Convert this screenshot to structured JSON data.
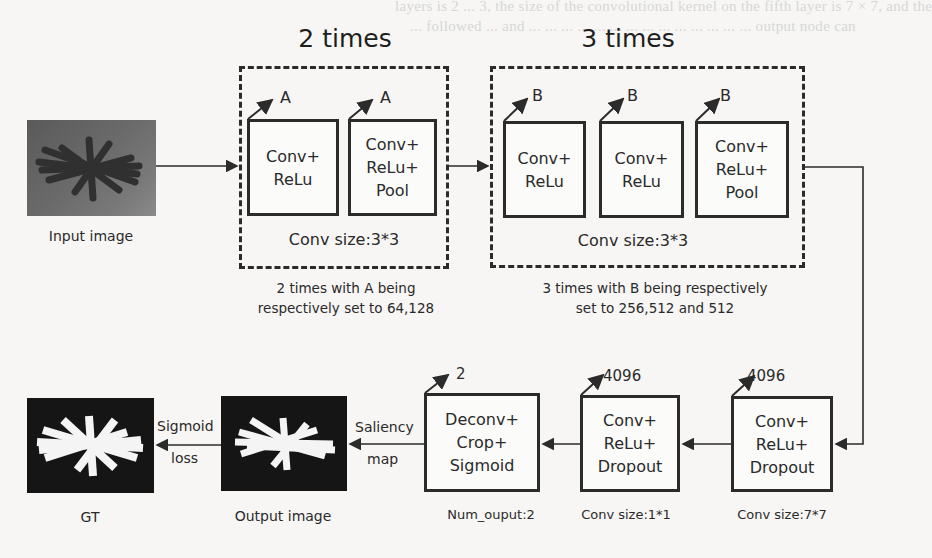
{
  "background_text": [
    "layers is 2 ... 3, the size of the convolutional kernel on the fifth layer is 7 × 7, and the",
    "... followed ... and ... ... ... ... ... ... ... ... ... ... ... ... ... ... output node can",
    "... ... ... ..."
  ],
  "group_a": {
    "title": "2 times",
    "param_label": "A",
    "blocks": [
      {
        "lines": [
          "Conv+",
          "ReLu"
        ]
      },
      {
        "lines": [
          "Conv+",
          "ReLu+",
          "Pool"
        ]
      }
    ],
    "conv_size": "Conv size:3*3",
    "caption_lines": [
      "2 times with A being",
      "respectively set to 64,128"
    ]
  },
  "group_b": {
    "title": "3 times",
    "param_label": "B",
    "blocks": [
      {
        "lines": [
          "Conv+",
          "ReLu"
        ]
      },
      {
        "lines": [
          "Conv+",
          "ReLu"
        ]
      },
      {
        "lines": [
          "Conv+",
          "ReLu+",
          "Pool"
        ]
      }
    ],
    "conv_size": "Conv size:3*3",
    "caption_lines": [
      "3 times with B being respectively",
      "set to 256,512 and 512"
    ]
  },
  "input_image": {
    "label": "Input image"
  },
  "bottom_row": {
    "fc6": {
      "out": "4096",
      "lines": [
        "Conv+",
        "ReLu+",
        "Dropout"
      ],
      "caption": "Conv size:7*7"
    },
    "fc7": {
      "out": "4096",
      "lines": [
        "Conv+",
        "ReLu+",
        "Dropout"
      ],
      "caption": "Conv size:1*1"
    },
    "deconv": {
      "out": "2",
      "lines": [
        "Deconv+",
        "Crop+",
        "Sigmoid"
      ],
      "caption": "Num_ouput:2"
    },
    "saliency_edge": [
      "Saliency",
      "map"
    ],
    "output_image": {
      "label": "Output image"
    },
    "loss_edge": [
      "Sigmoid",
      "loss"
    ],
    "gt_image": {
      "label": "GT"
    }
  },
  "colors": {
    "stroke": "#2b2b2b",
    "background": "#f7f6f4",
    "image_dark": "#151515",
    "mask_white": "#f4f4f4"
  }
}
